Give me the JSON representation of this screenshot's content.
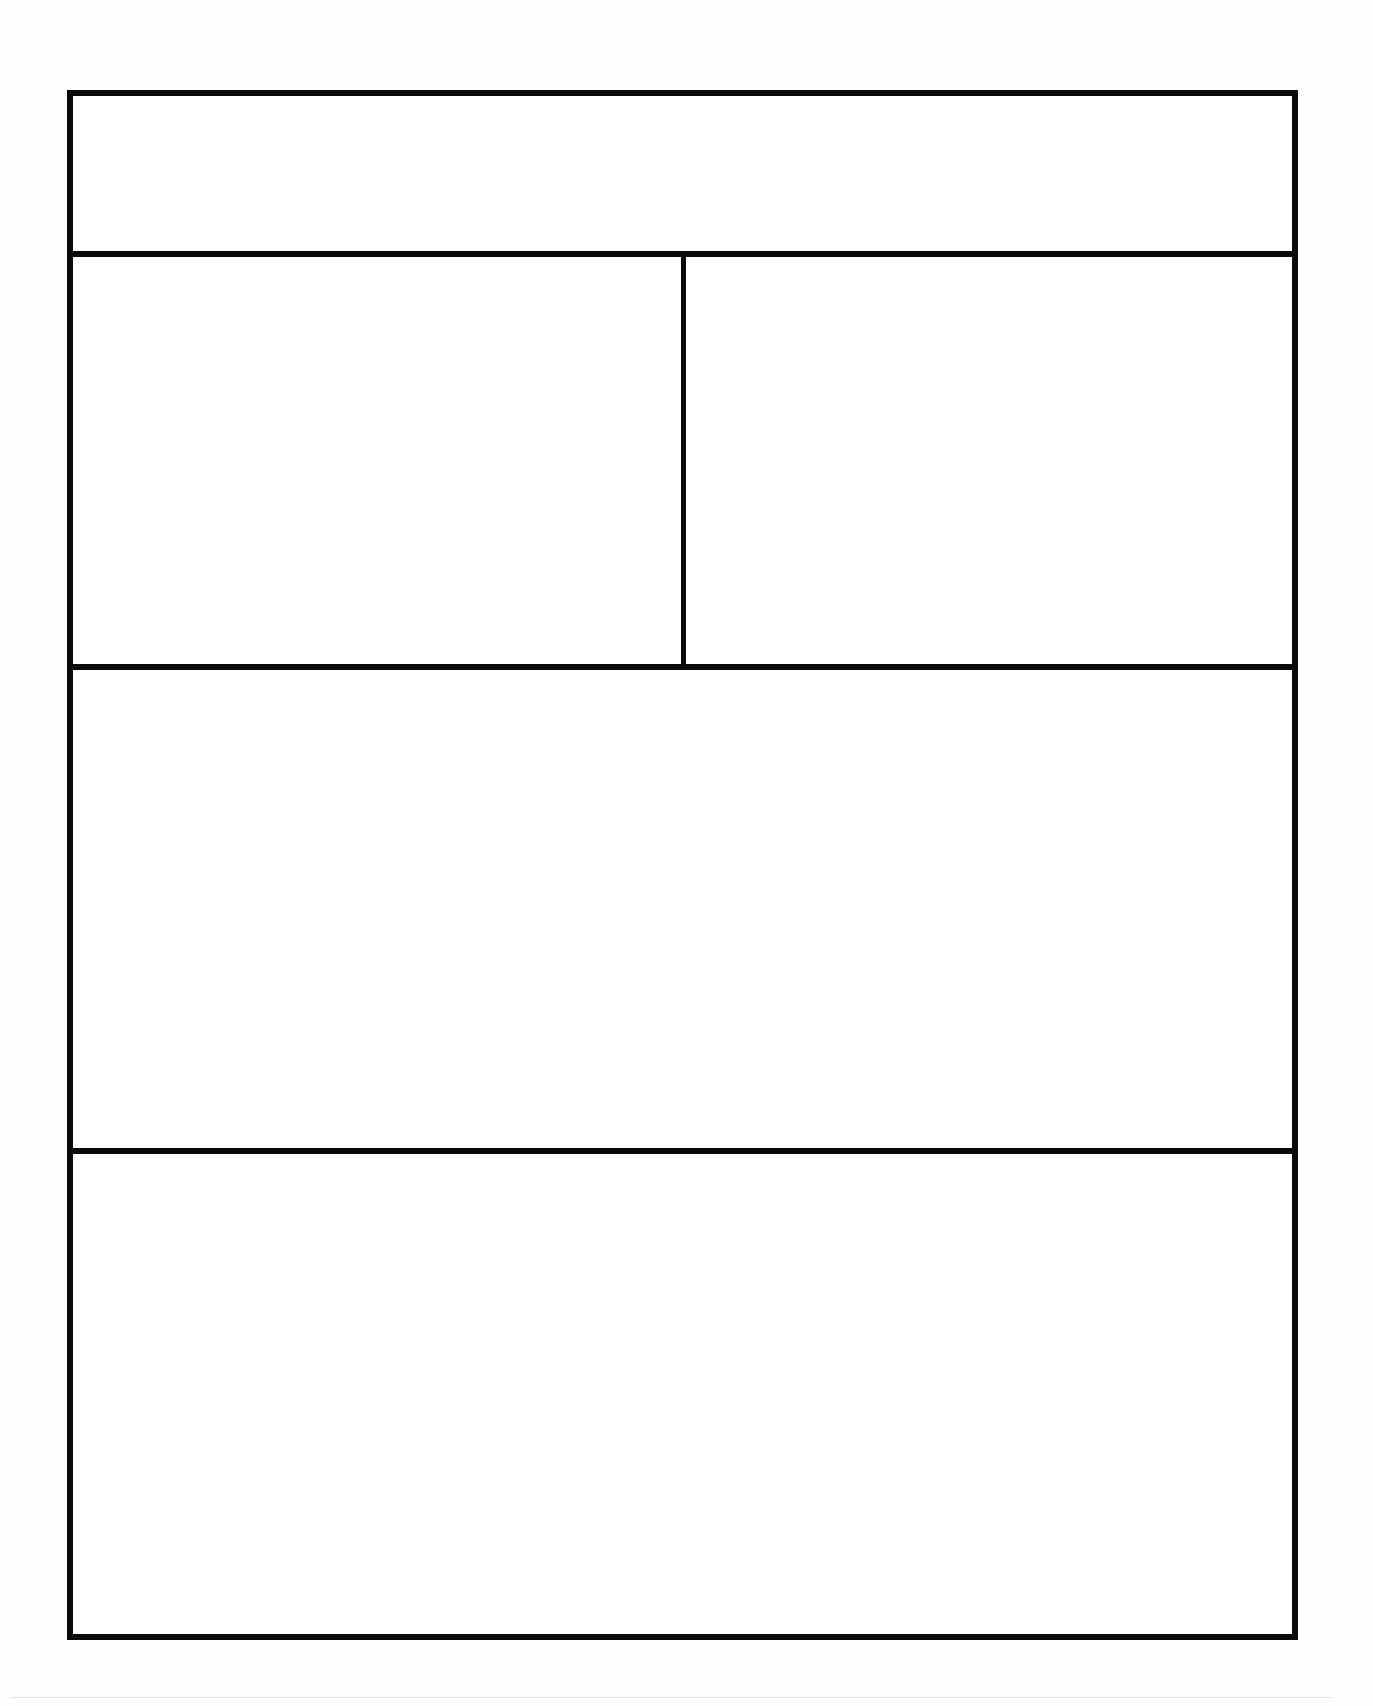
{
  "form": {
    "title": "",
    "sections": [
      {
        "id": "header",
        "label": "",
        "content": ""
      },
      {
        "id": "top-left",
        "label": "",
        "content": ""
      },
      {
        "id": "top-right",
        "label": "",
        "content": ""
      },
      {
        "id": "middle",
        "label": "",
        "content": ""
      },
      {
        "id": "bottom",
        "label": "",
        "content": ""
      }
    ]
  },
  "colors": {
    "border": "#0a0a0a",
    "background": "#ffffff"
  }
}
